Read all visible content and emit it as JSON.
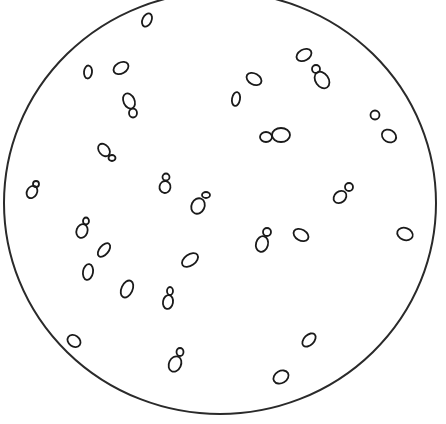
{
  "figure": {
    "background_color": "#ffffff",
    "line_color": "#1a1a1a",
    "field": {
      "cx": 220,
      "cy": 203,
      "rx": 216,
      "ry": 211
    }
  },
  "cells": [
    {
      "type": "single",
      "mother": {
        "cx": 147,
        "cy": 20,
        "rx": 4.5,
        "ry": 7,
        "rot": 25
      }
    },
    {
      "type": "single",
      "mother": {
        "cx": 88,
        "cy": 72,
        "rx": 4,
        "ry": 6.5,
        "rot": 5
      }
    },
    {
      "type": "single",
      "mother": {
        "cx": 121,
        "cy": 68,
        "rx": 8,
        "ry": 5.5,
        "rot": -30
      }
    },
    {
      "type": "budding",
      "mother": {
        "cx": 129,
        "cy": 101,
        "rx": 5.5,
        "ry": 8,
        "rot": -25
      },
      "bud": {
        "cx": 133,
        "cy": 113,
        "rx": 4,
        "ry": 4.5,
        "rot": 0
      }
    },
    {
      "type": "budding",
      "mother": {
        "cx": 104,
        "cy": 150,
        "rx": 5,
        "ry": 7,
        "rot": -40
      },
      "bud": {
        "cx": 112,
        "cy": 158,
        "rx": 3.5,
        "ry": 3,
        "rot": 0
      }
    },
    {
      "type": "budding",
      "mother": {
        "cx": 32,
        "cy": 192,
        "rx": 5,
        "ry": 6.5,
        "rot": 30
      },
      "bud": {
        "cx": 36,
        "cy": 184,
        "rx": 3,
        "ry": 3,
        "rot": 0
      }
    },
    {
      "type": "budding",
      "mother": {
        "cx": 165,
        "cy": 187,
        "rx": 5.5,
        "ry": 6,
        "rot": 10
      },
      "bud": {
        "cx": 166,
        "cy": 177,
        "rx": 3.5,
        "ry": 3.5,
        "rot": 0
      }
    },
    {
      "type": "budding",
      "mother": {
        "cx": 198,
        "cy": 206,
        "rx": 6.5,
        "ry": 8,
        "rot": 25
      },
      "bud": {
        "cx": 206,
        "cy": 195,
        "rx": 4,
        "ry": 3,
        "rot": 0
      }
    },
    {
      "type": "single",
      "mother": {
        "cx": 254,
        "cy": 79,
        "rx": 8,
        "ry": 5.5,
        "rot": 30
      }
    },
    {
      "type": "single",
      "mother": {
        "cx": 236,
        "cy": 99,
        "rx": 4,
        "ry": 7,
        "rot": 10
      }
    },
    {
      "type": "single",
      "mother": {
        "cx": 304,
        "cy": 55,
        "rx": 8,
        "ry": 5.5,
        "rot": -30
      }
    },
    {
      "type": "budding",
      "mother": {
        "cx": 322,
        "cy": 80,
        "rx": 6.5,
        "ry": 9,
        "rot": -35
      },
      "bud": {
        "cx": 316,
        "cy": 69,
        "rx": 4,
        "ry": 4,
        "rot": 0
      }
    },
    {
      "type": "pair",
      "mother": {
        "cx": 281,
        "cy": 135,
        "rx": 9,
        "ry": 7,
        "rot": 0
      },
      "bud": {
        "cx": 266,
        "cy": 137,
        "rx": 6,
        "ry": 5,
        "rot": 0
      }
    },
    {
      "type": "single",
      "mother": {
        "cx": 375,
        "cy": 115,
        "rx": 4.5,
        "ry": 4.5,
        "rot": 0
      }
    },
    {
      "type": "single",
      "mother": {
        "cx": 389,
        "cy": 136,
        "rx": 7.5,
        "ry": 6,
        "rot": 30
      }
    },
    {
      "type": "budding",
      "mother": {
        "cx": 340,
        "cy": 197,
        "rx": 7,
        "ry": 5.5,
        "rot": -40
      },
      "bud": {
        "cx": 349,
        "cy": 187,
        "rx": 4,
        "ry": 4,
        "rot": 0
      }
    },
    {
      "type": "budding",
      "mother": {
        "cx": 262,
        "cy": 244,
        "rx": 6,
        "ry": 8,
        "rot": 15
      },
      "bud": {
        "cx": 267,
        "cy": 232,
        "rx": 4,
        "ry": 4,
        "rot": 0
      }
    },
    {
      "type": "single",
      "mother": {
        "cx": 301,
        "cy": 235,
        "rx": 8,
        "ry": 5.5,
        "rot": 30
      }
    },
    {
      "type": "single",
      "mother": {
        "cx": 405,
        "cy": 234,
        "rx": 8,
        "ry": 6,
        "rot": 20
      }
    },
    {
      "type": "budding",
      "mother": {
        "cx": 82,
        "cy": 231,
        "rx": 5.5,
        "ry": 7,
        "rot": 20
      },
      "bud": {
        "cx": 86,
        "cy": 221,
        "rx": 3,
        "ry": 3.5,
        "rot": 0
      }
    },
    {
      "type": "single",
      "mother": {
        "cx": 104,
        "cy": 250,
        "rx": 4.5,
        "ry": 8,
        "rot": 40
      }
    },
    {
      "type": "single",
      "mother": {
        "cx": 88,
        "cy": 272,
        "rx": 5,
        "ry": 8,
        "rot": 10
      }
    },
    {
      "type": "single",
      "mother": {
        "cx": 127,
        "cy": 289,
        "rx": 5.5,
        "ry": 9,
        "rot": 25
      }
    },
    {
      "type": "budding",
      "mother": {
        "cx": 168,
        "cy": 302,
        "rx": 5,
        "ry": 7,
        "rot": 10
      },
      "bud": {
        "cx": 170,
        "cy": 291,
        "rx": 3,
        "ry": 4,
        "rot": 0
      }
    },
    {
      "type": "single",
      "mother": {
        "cx": 190,
        "cy": 260,
        "rx": 9,
        "ry": 5.5,
        "rot": -35
      }
    },
    {
      "type": "single",
      "mother": {
        "cx": 74,
        "cy": 341,
        "rx": 7,
        "ry": 5.5,
        "rot": 35
      }
    },
    {
      "type": "budding",
      "mother": {
        "cx": 175,
        "cy": 364,
        "rx": 6,
        "ry": 8,
        "rot": 25
      },
      "bud": {
        "cx": 180,
        "cy": 352,
        "rx": 3.5,
        "ry": 4,
        "rot": 0
      }
    },
    {
      "type": "single",
      "mother": {
        "cx": 309,
        "cy": 340,
        "rx": 8,
        "ry": 5,
        "rot": -45
      }
    },
    {
      "type": "single",
      "mother": {
        "cx": 281,
        "cy": 377,
        "rx": 8,
        "ry": 6,
        "rot": -30
      }
    }
  ],
  "counts": {
    "total_cells": 29
  }
}
